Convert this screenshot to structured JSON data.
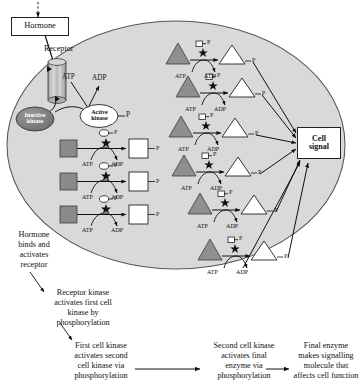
{
  "diagram": {
    "cell": {
      "fill": "#d9d9d9",
      "stroke": "#4a4a4a",
      "label": "cell-body"
    },
    "hormone": {
      "label": "Hormone",
      "incoming_arrow": "dashed"
    },
    "receptor": {
      "label": "Receptor",
      "shape": "cylinder"
    },
    "inactive_kinase": {
      "label": "Inactive\nkinase",
      "fill": "#808080"
    },
    "active_kinase": {
      "label": "Active\nkinase",
      "fill": "#ffffff",
      "phosphate": "P"
    },
    "receptor_energy": {
      "atp": "ATP",
      "adp": "ADP"
    },
    "cell_signal": {
      "label": "Cell\nsignal"
    },
    "reaction_labels": {
      "atp": "ATP",
      "adp": "ADP",
      "phosphate": "P",
      "star": "★"
    },
    "first_kinase_rows": [
      {
        "substrate": "square-grey",
        "product": "square-white",
        "catalyst": "circle-P",
        "atp": "ATP",
        "adp": "ADP",
        "product_p": "P",
        "catalyst_p": "P"
      },
      {
        "substrate": "square-grey",
        "product": "square-white",
        "catalyst": "circle-P",
        "atp": "ATP",
        "adp": "ADP",
        "product_p": "P",
        "catalyst_p": "P"
      },
      {
        "substrate": "square-grey",
        "product": "square-white",
        "catalyst": "circle-P",
        "atp": "ATP",
        "adp": "ADP",
        "product_p": "P",
        "catalyst_p": "P"
      }
    ],
    "second_kinase_rows": [
      {
        "substrate": "triangle-grey",
        "product": "triangle-white",
        "catalyst": "square-P",
        "atp": "ATP",
        "adp": "ADP",
        "product_p": "P",
        "catalyst_p": "P"
      },
      {
        "substrate": "triangle-grey",
        "product": "triangle-white",
        "catalyst": "square-P",
        "atp": "ATP",
        "adp": "ADP",
        "product_p": "P",
        "catalyst_p": "P"
      },
      {
        "substrate": "triangle-grey",
        "product": "triangle-white",
        "catalyst": "square-P",
        "atp": "ATP",
        "adp": "ADP",
        "product_p": "P",
        "catalyst_p": "P"
      },
      {
        "substrate": "triangle-grey",
        "product": "triangle-white",
        "catalyst": "square-P",
        "atp": "ATP",
        "adp": "ADP",
        "product_p": "P",
        "catalyst_p": "P"
      },
      {
        "substrate": "triangle-grey",
        "product": "triangle-white",
        "catalyst": "square-P",
        "atp": "ATP",
        "adp": "ADP",
        "product_p": "P",
        "catalyst_p": "P"
      },
      {
        "substrate": "triangle-grey",
        "product": "triangle-white",
        "catalyst": "square-P",
        "atp": "ATP",
        "adp": "ADP",
        "product_p": "P",
        "catalyst_p": "P"
      }
    ],
    "annotations": {
      "hormone_binds": "Hormone\nbinds and\nactivates\nreceptor",
      "receptor_kinase": "Receptor kinase\nactivates first cell\nkinase by\nphosphorylation",
      "first_cell_kinase": "First cell kinase\nactivates second\ncell kinase via\nphosphorylation",
      "second_cell_kinase": "Second cell kinase\nactivates final\nenzyme via\nphosphorylation",
      "final_enzyme": "Final enzyme\nmakes signalling\nmolecule that\naffects cell function"
    }
  }
}
